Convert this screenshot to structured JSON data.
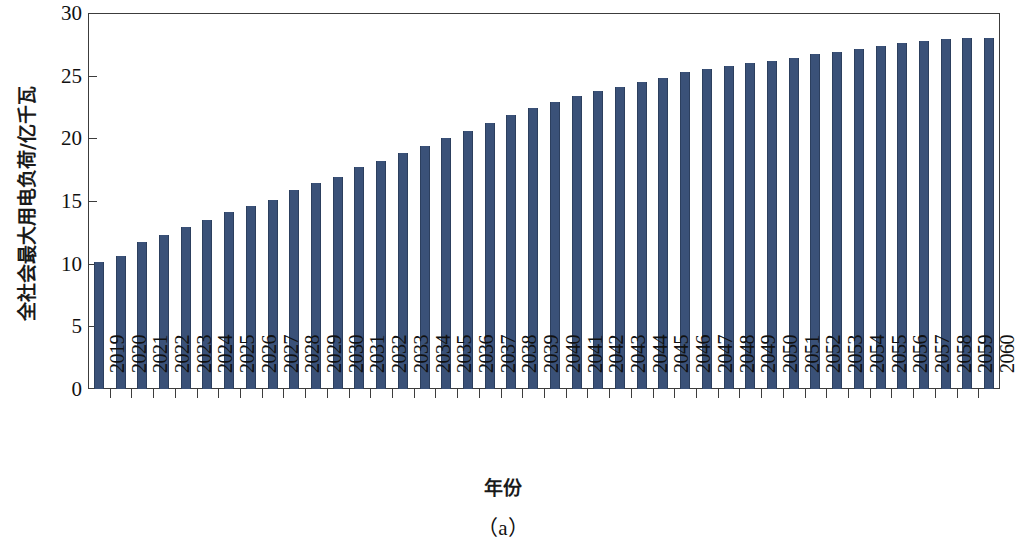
{
  "chart_data": {
    "type": "bar",
    "title": "",
    "caption": "（a）",
    "xlabel": "年份",
    "ylabel": "全社会最大用电负荷/亿千瓦",
    "ylim": [
      0,
      30
    ],
    "yticks": [
      0,
      5,
      10,
      15,
      20,
      25,
      30
    ],
    "ytick_labels": [
      "0",
      "5",
      "10",
      "15",
      "20",
      "25",
      "30"
    ],
    "grid": false,
    "legend": "none",
    "bar_color": "#3A5178",
    "categories": [
      "2019",
      "2020",
      "2021",
      "2022",
      "2023",
      "2024",
      "2025",
      "2026",
      "2027",
      "2028",
      "2029",
      "2030",
      "2031",
      "2032",
      "2033",
      "2034",
      "2035",
      "2036",
      "2037",
      "2038",
      "2039",
      "2040",
      "2041",
      "2042",
      "2043",
      "2044",
      "2045",
      "2046",
      "2047",
      "2048",
      "2049",
      "2050",
      "2051",
      "2052",
      "2053",
      "2054",
      "2055",
      "2056",
      "2057",
      "2058",
      "2059",
      "2060"
    ],
    "values": [
      10.1,
      10.6,
      11.7,
      12.3,
      12.9,
      13.5,
      14.1,
      14.6,
      15.1,
      15.9,
      16.4,
      16.9,
      17.7,
      18.2,
      18.8,
      19.4,
      20.0,
      20.6,
      21.2,
      21.9,
      22.4,
      22.9,
      23.4,
      23.8,
      24.1,
      24.5,
      24.8,
      25.3,
      25.5,
      25.8,
      26.0,
      26.2,
      26.4,
      26.7,
      26.9,
      27.1,
      27.4,
      27.6,
      27.8,
      27.9,
      28.0,
      28.0
    ],
    "unit": "亿千瓦"
  },
  "axes": {
    "y_title": "全社会最大用电负荷/亿千瓦",
    "x_title": "年份"
  },
  "figure": {
    "caption": "（a）"
  }
}
